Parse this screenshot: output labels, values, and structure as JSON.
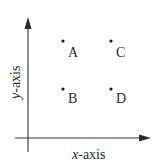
{
  "diagram": {
    "x_axis_label_var": "x",
    "x_axis_label_rest": "-axis",
    "y_axis_label_var": "y",
    "y_axis_label_rest": "-axis",
    "points": [
      {
        "label": "A",
        "position": "top-left"
      },
      {
        "label": "C",
        "position": "top-right"
      },
      {
        "label": "B",
        "position": "bottom-left"
      },
      {
        "label": "D",
        "position": "bottom-right"
      }
    ],
    "colors": {
      "axis": "#3a3a3a",
      "text": "#2a2a2a",
      "background": "#ffffff"
    }
  }
}
